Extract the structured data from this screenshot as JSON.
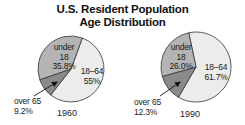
{
  "chart_data": [
    {
      "type": "pie",
      "title": "U.S. Resident Population Age Distribution",
      "subtitle": "1960",
      "categories": [
        "under 18",
        "18–64",
        "over 65"
      ],
      "values": [
        35.8,
        55.0,
        9.2
      ],
      "labels": [
        "under 18\n35.8%",
        "18–64\n55%",
        "over 65\n9.2%"
      ],
      "colors": [
        "#b4b4b4",
        "#ececec",
        "#8a8a8a"
      ]
    },
    {
      "type": "pie",
      "title": "U.S. Resident Population Age Distribution",
      "subtitle": "1990",
      "categories": [
        "under 18",
        "18–64",
        "over 65"
      ],
      "values": [
        26.0,
        61.7,
        12.3
      ],
      "labels": [
        "under 18\n26.0%",
        "18–64\n61.7%",
        "over 65\n12.3%"
      ],
      "colors": [
        "#b4b4b4",
        "#ececec",
        "#8a8a8a"
      ]
    }
  ],
  "header": {
    "title_line1": "U.S. Resident Population",
    "title_line2": "Age Distribution"
  },
  "pie1960": {
    "year": "1960",
    "under18": {
      "name_l1": "under",
      "name_l2": "18",
      "pct": "35.8%"
    },
    "adult": {
      "name": "18–64",
      "pct": "55%"
    },
    "over65": {
      "name": "over 65",
      "pct": "9.2%"
    }
  },
  "pie1990": {
    "year": "1990",
    "under18": {
      "name_l1": "under",
      "name_l2": "18",
      "pct": "26.0%"
    },
    "adult": {
      "name": "18–64",
      "pct": "61.7%"
    },
    "over65": {
      "name": "over 65",
      "pct": "12.3%"
    }
  },
  "colors": {
    "under18": "#b4b4b4",
    "adult": "#ececec",
    "over65": "#8a8a8a",
    "stroke": "#333333"
  }
}
